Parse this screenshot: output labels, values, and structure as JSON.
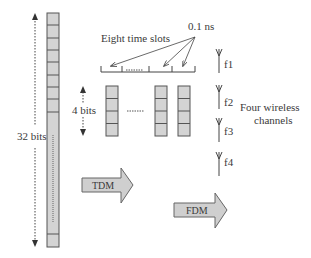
{
  "diagram": {
    "labels": {
      "bits_32": "32 bits",
      "bits_4": "4 bits",
      "eight_slots": "Eight time  slots",
      "slot_time": "0.1 ns",
      "channels_line1": "Four wireless",
      "channels_line2": "channels",
      "tdm": "TDM",
      "fdm": "FDM"
    },
    "frequencies": [
      "f1",
      "f2",
      "f3",
      "f4"
    ],
    "colors": {
      "cell_fill": "#d4d4d4",
      "cell_stroke": "#555555",
      "arrow_fill": "#cfcfcf",
      "line": "#444444"
    }
  }
}
